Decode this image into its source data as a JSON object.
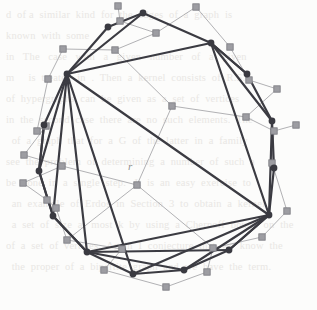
{
  "figure": {
    "kind": "graph-drawing",
    "caption_label": "r",
    "label_position": {
      "x": 128,
      "y": 160
    },
    "colors": {
      "page_background": "#fcfcfb",
      "primary_edge": "#3b3b42",
      "primary_vertex_fill": "#3a3a41",
      "secondary_edge": "#a8a8ac",
      "secondary_node_fill": "#9d9da2",
      "secondary_node_stroke": "#7b7b80",
      "bleed_text": "#e9e7e4"
    },
    "style": {
      "primary_edge_width": 2.2,
      "secondary_edge_width": 0.9,
      "primary_vertex_radius": 3.4,
      "secondary_node_size": 6.4
    }
  },
  "graph_data": {
    "type": "node-link-diagram",
    "primary_nodes": [
      {
        "id": "p0",
        "name": "v1",
        "x": 143,
        "y": 13
      },
      {
        "id": "p1",
        "name": "v2",
        "x": 108,
        "y": 27
      },
      {
        "id": "p2",
        "name": "v3",
        "x": 67,
        "y": 74
      },
      {
        "id": "p3",
        "name": "v4",
        "x": 44,
        "y": 125
      },
      {
        "id": "p4",
        "name": "v5",
        "x": 39,
        "y": 171
      },
      {
        "id": "p5",
        "name": "v6",
        "x": 53,
        "y": 216
      },
      {
        "id": "p6",
        "name": "v7",
        "x": 87,
        "y": 252
      },
      {
        "id": "p7",
        "name": "v8",
        "x": 133,
        "y": 274
      },
      {
        "id": "p8",
        "name": "v9",
        "x": 184,
        "y": 270
      },
      {
        "id": "p9",
        "name": "v10",
        "x": 229,
        "y": 250
      },
      {
        "id": "p10",
        "name": "v11",
        "x": 269,
        "y": 215
      },
      {
        "id": "p11",
        "name": "v12",
        "x": 274,
        "y": 168
      },
      {
        "id": "p12",
        "name": "v13",
        "x": 272,
        "y": 121
      },
      {
        "id": "p13",
        "name": "v14",
        "x": 247,
        "y": 74
      },
      {
        "id": "p14",
        "name": "v15",
        "x": 211,
        "y": 43
      }
    ],
    "primary_edges": [
      [
        "p0",
        "p1"
      ],
      [
        "p1",
        "p2"
      ],
      [
        "p2",
        "p3"
      ],
      [
        "p3",
        "p4"
      ],
      [
        "p4",
        "p5"
      ],
      [
        "p5",
        "p6"
      ],
      [
        "p6",
        "p7"
      ],
      [
        "p7",
        "p8"
      ],
      [
        "p8",
        "p9"
      ],
      [
        "p9",
        "p10"
      ],
      [
        "p10",
        "p11"
      ],
      [
        "p11",
        "p12"
      ],
      [
        "p12",
        "p13"
      ],
      [
        "p13",
        "p14"
      ],
      [
        "p14",
        "p0"
      ],
      [
        "p2",
        "p14"
      ],
      [
        "p2",
        "p0"
      ],
      [
        "p2",
        "p10"
      ],
      [
        "p2",
        "p6"
      ],
      [
        "p2",
        "p4"
      ],
      [
        "p2",
        "p5"
      ],
      [
        "p2",
        "p7"
      ],
      [
        "p14",
        "p10"
      ],
      [
        "p14",
        "p12"
      ],
      [
        "p14",
        "p13"
      ],
      [
        "p10",
        "p6"
      ],
      [
        "p10",
        "p7"
      ],
      [
        "p10",
        "p8"
      ],
      [
        "p10",
        "p9"
      ],
      [
        "p10",
        "p12"
      ],
      [
        "p6",
        "p5"
      ],
      [
        "p6",
        "p8"
      ],
      [
        "p6",
        "p9"
      ],
      [
        "p4",
        "p5"
      ],
      [
        "p4",
        "p3"
      ]
    ],
    "secondary_nodes": [
      {
        "id": "s0",
        "name": "c1",
        "x": 120,
        "y": 21
      },
      {
        "id": "s1",
        "name": "c2",
        "x": 156,
        "y": 33
      },
      {
        "id": "s2",
        "name": "c3",
        "x": 115,
        "y": 50
      },
      {
        "id": "s3",
        "name": "c4",
        "x": 63,
        "y": 49
      },
      {
        "id": "s4",
        "name": "c5",
        "x": 196,
        "y": 7
      },
      {
        "id": "s5",
        "name": "c6",
        "x": 118,
        "y": 6
      },
      {
        "id": "s6",
        "name": "c7",
        "x": 230,
        "y": 47
      },
      {
        "id": "s7",
        "name": "c8",
        "x": 249,
        "y": 80
      },
      {
        "id": "s8",
        "name": "c9",
        "x": 277,
        "y": 89
      },
      {
        "id": "s9",
        "name": "c10",
        "x": 296,
        "y": 125
      },
      {
        "id": "s10",
        "name": "c11",
        "x": 274,
        "y": 131
      },
      {
        "id": "s11",
        "name": "c12",
        "x": 272,
        "y": 163
      },
      {
        "id": "s12",
        "name": "c13",
        "x": 287,
        "y": 211
      },
      {
        "id": "s13",
        "name": "c14",
        "x": 262,
        "y": 237
      },
      {
        "id": "s14",
        "name": "c15",
        "x": 213,
        "y": 248
      },
      {
        "id": "s15",
        "name": "c16",
        "x": 207,
        "y": 272
      },
      {
        "id": "s16",
        "name": "c17",
        "x": 166,
        "y": 287
      },
      {
        "id": "s17",
        "name": "c18",
        "x": 104,
        "y": 270
      },
      {
        "id": "s18",
        "name": "c19",
        "x": 122,
        "y": 249
      },
      {
        "id": "s19",
        "name": "c20",
        "x": 67,
        "y": 240
      },
      {
        "id": "s20",
        "name": "c21",
        "x": 47,
        "y": 200
      },
      {
        "id": "s21",
        "name": "c22",
        "x": 56,
        "y": 208
      },
      {
        "id": "s22",
        "name": "c23",
        "x": 23,
        "y": 183
      },
      {
        "id": "s23",
        "name": "c24",
        "x": 62,
        "y": 166
      },
      {
        "id": "s24",
        "name": "c25",
        "x": 24,
        "y": 155
      },
      {
        "id": "s25",
        "name": "c26",
        "x": 37,
        "y": 131
      },
      {
        "id": "s26",
        "name": "c27",
        "x": 46,
        "y": 126
      },
      {
        "id": "s27",
        "name": "c28",
        "x": 48,
        "y": 79
      },
      {
        "id": "s28",
        "name": "c29",
        "x": 172,
        "y": 106
      },
      {
        "id": "s29",
        "name": "c30",
        "x": 137,
        "y": 185
      },
      {
        "id": "s30",
        "name": "c31",
        "x": 246,
        "y": 117
      }
    ],
    "secondary_edges": [
      [
        "s5",
        "s0"
      ],
      [
        "s0",
        "s1"
      ],
      [
        "s1",
        "s2"
      ],
      [
        "s2",
        "s3"
      ],
      [
        "s4",
        "s1"
      ],
      [
        "s4",
        "s6"
      ],
      [
        "s6",
        "s7"
      ],
      [
        "s7",
        "s8"
      ],
      [
        "s8",
        "s30"
      ],
      [
        "s30",
        "s10"
      ],
      [
        "s10",
        "s9"
      ],
      [
        "s10",
        "s11"
      ],
      [
        "s11",
        "s12"
      ],
      [
        "s12",
        "s13"
      ],
      [
        "s13",
        "s14"
      ],
      [
        "s14",
        "s15"
      ],
      [
        "s15",
        "s16"
      ],
      [
        "s16",
        "s17"
      ],
      [
        "s17",
        "s18"
      ],
      [
        "s18",
        "s19"
      ],
      [
        "s19",
        "s21"
      ],
      [
        "s21",
        "s20"
      ],
      [
        "s20",
        "s22"
      ],
      [
        "s22",
        "s23"
      ],
      [
        "s23",
        "s24"
      ],
      [
        "s24",
        "s26"
      ],
      [
        "s26",
        "s25"
      ],
      [
        "s25",
        "s27"
      ],
      [
        "s27",
        "s3"
      ],
      [
        "s28",
        "s29"
      ],
      [
        "s28",
        "s30"
      ],
      [
        "s29",
        "s23"
      ],
      [
        "s29",
        "s19"
      ],
      [
        "s29",
        "s14"
      ],
      [
        "s2",
        "s28"
      ]
    ]
  },
  "bleed_text": {
    "lines": [
      "d  of a  similar  kind  for  the  edges  of  a  graph  is",
      "known  with  some",
      "",
      "in   The   case   with   a   given   number   of   a   given",
      "m     is  treated  in  .  Then  a  kernel  consists  of  R.S.",
      "",
      "of  hypergraphs  can  be  given  as  a  set  of  vertices",
      "in  the  second  case  there  are  no  such  elements.  The",
      "  of  a  graph  that  for  a  G  of  the  latter  in  a  family",
      "see  the  problem  of  determining  a  number  of  such  a",
      "be  done  in  a  single  step.   It  is  an  easy  exercise  to",
      "  an  example  of  Erdos  in  Section  3  to  obtain  a  kernel",
      "  a  set  of  size  at  most  k  by  using  a  Chernoff  bound  on  the",
      "of  a  set  of  vertices.  Again  I  conjecture  that  we  know  the",
      "  the  proper  of  a  bipartite  graph  and  we  have  the  term."
    ]
  }
}
